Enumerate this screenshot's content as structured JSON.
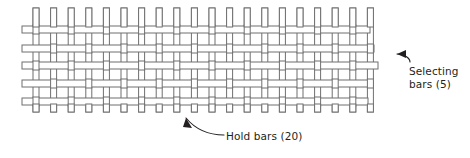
{
  "diagram": {
    "background_color": "#ffffff",
    "bar_fill_color": "#ffffff",
    "bar_stroke_color": "#6f6f6f",
    "annotation_color": "#231f20",
    "annotations": [
      {
        "id": "selecting-bars",
        "line1": "Selecting",
        "line2": "bars (5)",
        "full_text": "Selecting bars (5)",
        "count": 5,
        "arrow_direction": "left",
        "points_to": "horizontal-bar-3"
      },
      {
        "id": "hold-bars",
        "line1": "Hold bars (20)",
        "line2": "",
        "full_text": "Hold bars (20)",
        "count": 20,
        "arrow_direction": "up-left",
        "points_to": "vertical-bar-row-bottom"
      }
    ]
  },
  "chart_data": {
    "type": "diagram",
    "horizontal_bars": {
      "name": "Selecting bars",
      "count": 5,
      "orientation": "horizontal",
      "x_start": 22,
      "y_positions": [
        26,
        45,
        62,
        80,
        98
      ],
      "thickness": 7,
      "x_ends": [
        370,
        374,
        378,
        372,
        368
      ]
    },
    "vertical_bars": {
      "name": "Hold bars",
      "count": 20,
      "orientation": "vertical",
      "y_start": 8,
      "y_end": 112,
      "x_first": 33,
      "x_spacing": 17.6,
      "thickness": 6
    }
  }
}
